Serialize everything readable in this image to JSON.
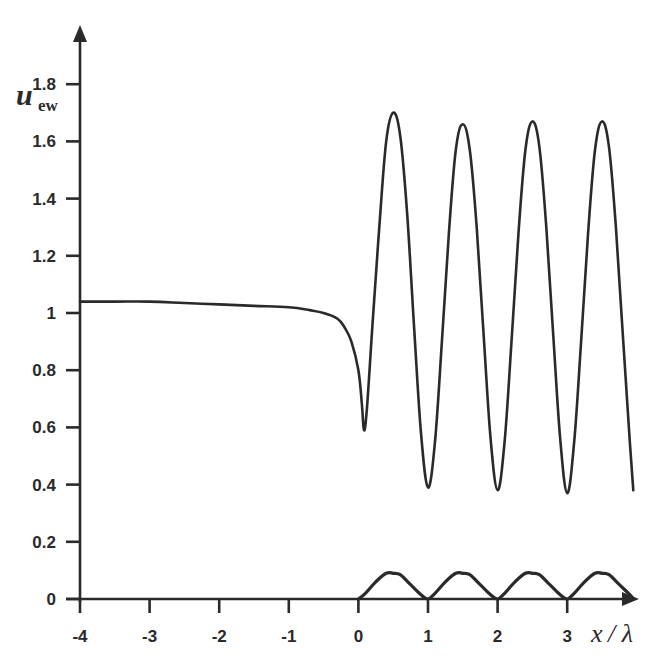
{
  "chart_data": {
    "type": "line",
    "title": "",
    "xlabel": "x / λ",
    "ylabel": "u_ew",
    "ylabel_main": "u",
    "ylabel_sub": "ew",
    "xlabel_var": "x",
    "xlabel_rest": " / λ",
    "xlim": [
      -4,
      4
    ],
    "ylim": [
      0,
      1.9
    ],
    "grid": false,
    "legend": null,
    "x_ticks": [
      -4,
      -3,
      -2,
      -1,
      0,
      1,
      2,
      3
    ],
    "x_tick_labels": [
      "-4",
      "-3",
      "-2",
      "-1",
      "0",
      "1",
      "2",
      "3"
    ],
    "y_ticks": [
      0,
      0.2,
      0.4,
      0.6,
      0.8,
      1,
      1.2,
      1.4,
      1.6,
      1.8
    ],
    "y_tick_labels": [
      "0",
      "0.2",
      "0.4",
      "0.6",
      "0.8",
      "1",
      "1.2",
      "1.4",
      "1.6",
      "1.8"
    ],
    "series": [
      {
        "name": "upper curve",
        "stroke": "#2a2a2a",
        "x": [
          -4.0,
          -3.5,
          -3.0,
          -2.5,
          -2.0,
          -1.5,
          -1.0,
          -0.7,
          -0.5,
          -0.3,
          -0.2,
          -0.1,
          0.0,
          0.05,
          0.08,
          0.12,
          0.2,
          0.3,
          0.4,
          0.5,
          0.6,
          0.7,
          0.8,
          0.9,
          1.0,
          1.1,
          1.2,
          1.3,
          1.4,
          1.5,
          1.6,
          1.7,
          1.8,
          1.9,
          2.0,
          2.1,
          2.2,
          2.3,
          2.4,
          2.5,
          2.6,
          2.7,
          2.8,
          2.9,
          3.0,
          3.1,
          3.2,
          3.3,
          3.4,
          3.5,
          3.6,
          3.7,
          3.8,
          3.9,
          3.95
        ],
        "y": [
          1.04,
          1.04,
          1.04,
          1.035,
          1.03,
          1.025,
          1.02,
          1.01,
          1.0,
          0.98,
          0.95,
          0.9,
          0.8,
          0.68,
          0.59,
          0.66,
          0.95,
          1.3,
          1.6,
          1.7,
          1.62,
          1.35,
          0.95,
          0.58,
          0.39,
          0.55,
          0.9,
          1.28,
          1.57,
          1.66,
          1.57,
          1.3,
          0.92,
          0.56,
          0.38,
          0.55,
          0.9,
          1.28,
          1.57,
          1.67,
          1.58,
          1.3,
          0.92,
          0.56,
          0.37,
          0.55,
          0.9,
          1.28,
          1.57,
          1.67,
          1.58,
          1.3,
          0.92,
          0.55,
          0.38
        ]
      },
      {
        "name": "lower curve",
        "stroke": "#2a2a2a",
        "x": [
          0.0,
          0.1,
          0.25,
          0.4,
          0.5,
          0.6,
          0.75,
          0.9,
          1.0,
          1.1,
          1.25,
          1.4,
          1.5,
          1.6,
          1.75,
          1.9,
          2.0,
          2.1,
          2.25,
          2.4,
          2.5,
          2.6,
          2.75,
          2.9,
          3.0,
          3.1,
          3.25,
          3.4,
          3.5,
          3.6,
          3.75,
          3.9,
          3.95
        ],
        "y": [
          0.0,
          0.02,
          0.06,
          0.09,
          0.09,
          0.085,
          0.05,
          0.015,
          0.0,
          0.02,
          0.06,
          0.09,
          0.09,
          0.085,
          0.05,
          0.015,
          0.0,
          0.02,
          0.06,
          0.09,
          0.09,
          0.085,
          0.05,
          0.015,
          0.0,
          0.02,
          0.06,
          0.09,
          0.09,
          0.085,
          0.05,
          0.015,
          0.0
        ]
      }
    ]
  },
  "style": {
    "axis_color": "#2a2a2a",
    "background": "#ffffff"
  }
}
